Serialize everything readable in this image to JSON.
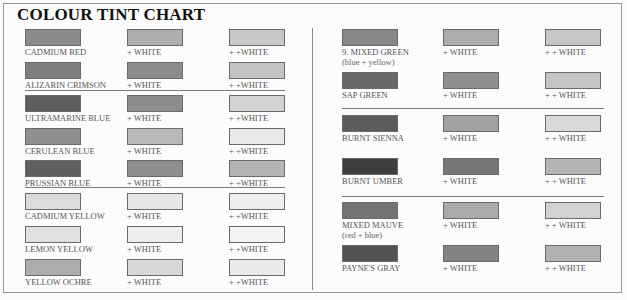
{
  "title": "COLOUR TINT CHART",
  "left_column": [
    {
      "name": "CADMIUM RED",
      "sub": "",
      "tints": [
        {
          "label": "",
          "color": "#8a8a8a"
        },
        {
          "label": "+ WHITE",
          "color": "#aeaeae"
        },
        {
          "label": "+ +WHITE",
          "color": "#c7c7c7"
        }
      ]
    },
    {
      "name": "ALIZARIN CRIMSON",
      "sub": "",
      "tints": [
        {
          "label": "",
          "color": "#7e7e7e"
        },
        {
          "label": "+ WHITE",
          "color": "#8c8c8c"
        },
        {
          "label": "+ +WHITE",
          "color": "#c3c3c3"
        }
      ]
    },
    {
      "name": "ULTRAMARINE BLUE",
      "sub": "",
      "tints": [
        {
          "label": "",
          "color": "#5e5e5e"
        },
        {
          "label": "+ WHITE",
          "color": "#8d8d8d"
        },
        {
          "label": "+ +WHITE",
          "color": "#d2d2d2"
        }
      ]
    },
    {
      "name": "CERULEAN BLUE",
      "sub": "",
      "tints": [
        {
          "label": "",
          "color": "#8f8f8f"
        },
        {
          "label": "+ WHITE",
          "color": "#b8b8b8"
        },
        {
          "label": "+ +WHITE",
          "color": "#e8e8e8"
        }
      ]
    },
    {
      "name": "PRUSSIAN BLUE",
      "sub": "",
      "tints": [
        {
          "label": "",
          "color": "#5f5f5f"
        },
        {
          "label": "+ WHITE",
          "color": "#8e8e8e"
        },
        {
          "label": "+ +WHITE",
          "color": "#b5b5b5"
        }
      ]
    },
    {
      "name": "CADMIUM YELLOW",
      "sub": "",
      "tints": [
        {
          "label": "",
          "color": "#dcdcdc"
        },
        {
          "label": "+ WHITE",
          "color": "#e7e7e7"
        },
        {
          "label": "+ +WHITE",
          "color": "#eeeeee"
        }
      ]
    },
    {
      "name": "LEMON YELLOW",
      "sub": "",
      "tints": [
        {
          "label": "",
          "color": "#e0e0e0"
        },
        {
          "label": "+ WHITE",
          "color": "#eeeeee"
        },
        {
          "label": "+ +WHITE",
          "color": "#f3f3f3"
        }
      ]
    },
    {
      "name": "YELLOW OCHRE",
      "sub": "",
      "tints": [
        {
          "label": "",
          "color": "#acacac"
        },
        {
          "label": "+ WHITE",
          "color": "#d8d8d8"
        },
        {
          "label": "+ +WHITE",
          "color": "#e9e9e9"
        }
      ]
    }
  ],
  "right_column": [
    {
      "name": "9. MIXED GREEN",
      "sub": "(blue + yellow)",
      "tints": [
        {
          "label": "",
          "color": "#888888"
        },
        {
          "label": "+ WHITE",
          "color": "#acacac"
        },
        {
          "label": "+ + WHITE",
          "color": "#c6c6c6"
        }
      ]
    },
    {
      "name": "SAP GREEN",
      "sub": "",
      "tints": [
        {
          "label": "",
          "color": "#686868"
        },
        {
          "label": "+ WHITE",
          "color": "#8f8f8f"
        },
        {
          "label": "+ + WHITE",
          "color": "#c5c5c5"
        }
      ]
    },
    {
      "name": "BURNT SIENNA",
      "sub": "",
      "tints": [
        {
          "label": "",
          "color": "#5c5c5c"
        },
        {
          "label": "+ WHITE",
          "color": "#a2a2a2"
        },
        {
          "label": "+ + WHITE",
          "color": "#d9d9d9"
        }
      ]
    },
    {
      "name": "BURNT UMBER",
      "sub": "",
      "tints": [
        {
          "label": "",
          "color": "#3e3e3e"
        },
        {
          "label": "+ WHITE",
          "color": "#767676"
        },
        {
          "label": "+ + WHITE",
          "color": "#b5b5b5"
        }
      ]
    },
    {
      "name": "MIXED MAUVE",
      "sub": "(red + blue)",
      "tints": [
        {
          "label": "",
          "color": "#737373"
        },
        {
          "label": "+ WHITE",
          "color": "#aaaaaa"
        },
        {
          "label": "+ + WHITE",
          "color": "#d2d2d2"
        }
      ]
    },
    {
      "name": "PAYNE'S GRAY",
      "sub": "",
      "tints": [
        {
          "label": "",
          "color": "#525252"
        },
        {
          "label": "+ WHITE",
          "color": "#838383"
        },
        {
          "label": "+ + WHITE",
          "color": "#b1b1b1"
        }
      ]
    }
  ]
}
